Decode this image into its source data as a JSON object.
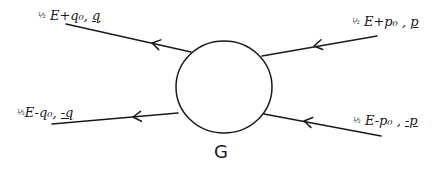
{
  "diagram": {
    "type": "feynman-vertex",
    "stroke_color": "#1a1a1a",
    "background": "#ffffff",
    "blob": {
      "label": "G",
      "cx": 224,
      "cy": 87,
      "r": 47
    },
    "legs": [
      {
        "id": "top-left",
        "label": {
          "frac": "½",
          "energy": " E+q₀, ",
          "momentum": "q"
        },
        "line": {
          "x1": 66,
          "y1": 24,
          "x2": 191,
          "y2": 52
        },
        "arrow_at": {
          "x": 152,
          "y": 43
        },
        "arrow_direction": "left"
      },
      {
        "id": "top-right",
        "label": {
          "frac": "½",
          "energy": " E+p₀ , ",
          "momentum": "p"
        },
        "line": {
          "x1": 377,
          "y1": 36,
          "x2": 262,
          "y2": 56
        },
        "arrow_at": {
          "x": 314,
          "y": 46
        },
        "arrow_direction": "left"
      },
      {
        "id": "bottom-left",
        "label": {
          "frac": "½",
          "energy": "E-q₀, ",
          "momentum": "-q"
        },
        "line": {
          "x1": 52,
          "y1": 124,
          "x2": 178,
          "y2": 113
        },
        "arrow_at": {
          "x": 133,
          "y": 117
        },
        "arrow_direction": "left"
      },
      {
        "id": "bottom-right",
        "label": {
          "frac": "½",
          "energy": " E-p₀ , ",
          "momentum": "-p"
        },
        "line": {
          "x1": 264,
          "y1": 114,
          "x2": 381,
          "y2": 136
        },
        "arrow_at": {
          "x": 304,
          "y": 121
        },
        "arrow_direction": "left"
      }
    ]
  }
}
